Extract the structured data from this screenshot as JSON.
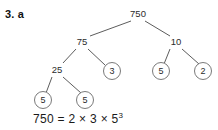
{
  "question": {
    "label": "3. a"
  },
  "diagram": {
    "type": "factor-tree",
    "title": "750",
    "colors": {
      "line": "#4a4a4a",
      "circle_stroke": "#6b6b6b",
      "text": "#2b2b2b",
      "background": "#ffffff"
    },
    "nodes": [
      {
        "id": "root",
        "value": "750",
        "x": 138,
        "y": 14,
        "circled": false
      },
      {
        "id": "n75",
        "value": "75",
        "x": 82,
        "y": 42,
        "circled": false
      },
      {
        "id": "n10",
        "value": "10",
        "x": 176,
        "y": 42,
        "circled": false
      },
      {
        "id": "n25",
        "value": "25",
        "x": 57,
        "y": 70,
        "circled": false
      },
      {
        "id": "n3",
        "value": "3",
        "x": 112,
        "y": 71,
        "circled": true
      },
      {
        "id": "n5r",
        "value": "5",
        "x": 161,
        "y": 71,
        "circled": true
      },
      {
        "id": "n2",
        "value": "2",
        "x": 203,
        "y": 71,
        "circled": true
      },
      {
        "id": "n5a",
        "value": "5",
        "x": 43,
        "y": 100,
        "circled": true
      },
      {
        "id": "n5b",
        "value": "5",
        "x": 85,
        "y": 100,
        "circled": true
      }
    ],
    "edges": [
      {
        "from": "root",
        "to": "n75"
      },
      {
        "from": "root",
        "to": "n10"
      },
      {
        "from": "n75",
        "to": "n25"
      },
      {
        "from": "n75",
        "to": "n3"
      },
      {
        "from": "n10",
        "to": "n5r"
      },
      {
        "from": "n10",
        "to": "n2"
      },
      {
        "from": "n25",
        "to": "n5a"
      },
      {
        "from": "n25",
        "to": "n5b"
      }
    ]
  },
  "equation": {
    "base": "750 = 2 × 3 × 5",
    "exponent": "3",
    "full": "750 = 2 × 3 × 5³",
    "result_value": 750,
    "factors": [
      2,
      3,
      5,
      5,
      5
    ]
  }
}
